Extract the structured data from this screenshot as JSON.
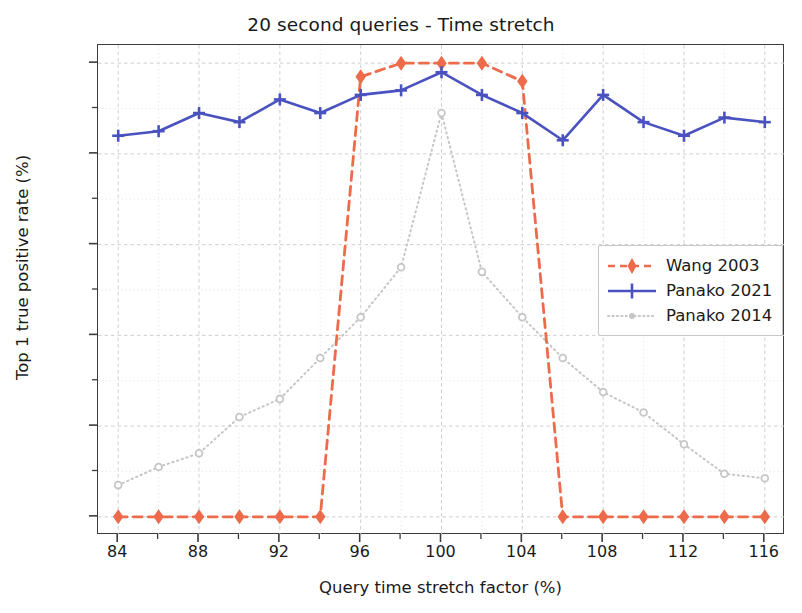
{
  "chart_data": {
    "type": "line",
    "title": "20 second queries - Time stretch",
    "xlabel": "Query time stretch factor (%)",
    "ylabel": "Top 1 true positive rate (%)",
    "xlim": [
      83,
      117
    ],
    "ylim": [
      -4,
      104
    ],
    "xticks": [
      84,
      88,
      92,
      96,
      100,
      104,
      108,
      112,
      116
    ],
    "xticks_minor": [
      86,
      90,
      94,
      98,
      102,
      106,
      110,
      114
    ],
    "yticks": [
      0,
      20,
      40,
      60,
      80,
      100
    ],
    "yticks_minor": [
      10,
      30,
      50,
      70,
      90
    ],
    "grid": true,
    "legend_position": "center right",
    "x": [
      84,
      86,
      88,
      90,
      92,
      94,
      96,
      98,
      100,
      102,
      104,
      106,
      108,
      110,
      112,
      114,
      116
    ],
    "series": [
      {
        "name": "Wang 2003",
        "color": "#ED6B4A",
        "style": "dashed",
        "marker": "diamond",
        "values": [
          0,
          0,
          0,
          0,
          0,
          0,
          97,
          100,
          100,
          100,
          96,
          0,
          0,
          0,
          0,
          0,
          0
        ]
      },
      {
        "name": "Panako 2021",
        "color": "#4A52C0",
        "style": "solid",
        "marker": "plus",
        "values": [
          84,
          85,
          89,
          87,
          92,
          89,
          93,
          94,
          98,
          93,
          89,
          83,
          93,
          87,
          84,
          88,
          87
        ]
      },
      {
        "name": "Panako 2014",
        "color": "#C6C6C6",
        "style": "dotted",
        "marker": "circle",
        "values": [
          7,
          11,
          14,
          22,
          26,
          35,
          44,
          55,
          89,
          54,
          44,
          35,
          27.5,
          23,
          16,
          9.5,
          8.5
        ]
      }
    ]
  },
  "axis": {
    "xtick_labels": [
      "84",
      "88",
      "92",
      "96",
      "100",
      "104",
      "108",
      "112",
      "116"
    ],
    "ytick_labels": [
      "0",
      "20",
      "40",
      "60",
      "80",
      "100"
    ]
  },
  "legend": {
    "entries": [
      {
        "label": "Wang 2003"
      },
      {
        "label": "Panako 2021"
      },
      {
        "label": "Panako 2014"
      }
    ]
  },
  "colors": {
    "wang": "#ED6B4A",
    "panako2021": "#4A52C0",
    "panako2014": "#C6C6C6",
    "axis": "#3c3c3c",
    "grid": "#d0d0d0",
    "text": "#1a1a1a"
  }
}
